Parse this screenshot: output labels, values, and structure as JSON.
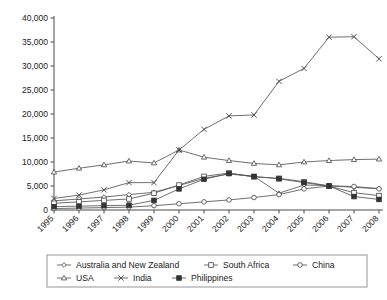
{
  "chart_data": {
    "type": "line",
    "title": "",
    "subtitle": "",
    "xlabel": "",
    "ylabel": "",
    "grid": false,
    "legend_position": "bottom",
    "categories": [
      "1995",
      "1996",
      "1997",
      "1998",
      "1999",
      "2000",
      "2001",
      "2002",
      "2003",
      "2004",
      "2005",
      "2006",
      "2007",
      "2008"
    ],
    "ylim": [
      0,
      40000
    ],
    "ytick_values": [
      0,
      5000,
      10000,
      15000,
      20000,
      25000,
      30000,
      35000,
      40000
    ],
    "ytick_labels": [
      "0",
      "5,000",
      "10,000",
      "15,000",
      "20,000",
      "25,000",
      "30,000",
      "35,000",
      "40,000"
    ],
    "series": [
      {
        "name": "Australia and New Zealand",
        "marker": "diamond",
        "values": [
          1900,
          2300,
          2700,
          3200,
          3700,
          5100,
          6600,
          7500,
          7000,
          3500,
          5200,
          5100,
          4700,
          4500
        ]
      },
      {
        "name": "South Africa",
        "marker": "square",
        "values": [
          1400,
          1700,
          2000,
          2300,
          3500,
          5200,
          7000,
          7700,
          6900,
          6600,
          5900,
          5000,
          3600,
          3000
        ]
      },
      {
        "name": "China",
        "marker": "circle",
        "values": [
          300,
          400,
          500,
          600,
          900,
          1300,
          1700,
          2100,
          2600,
          3200,
          4400,
          5000,
          4900,
          4400
        ]
      },
      {
        "name": "USA",
        "marker": "triangle",
        "values": [
          7900,
          8700,
          9400,
          10200,
          9800,
          12500,
          11000,
          10300,
          9700,
          9400,
          10000,
          10300,
          10500,
          10600
        ]
      },
      {
        "name": "India",
        "marker": "cross",
        "values": [
          2400,
          3100,
          4200,
          5700,
          5700,
          12500,
          16800,
          19600,
          19800,
          26800,
          29500,
          36000,
          36100,
          31500
        ]
      },
      {
        "name": "Philippines",
        "marker": "filled-square",
        "values": [
          700,
          800,
          900,
          1000,
          2000,
          4400,
          6400,
          7600,
          7000,
          6500,
          5700,
          5000,
          2800,
          2200
        ]
      }
    ]
  },
  "legend": {
    "entries": [
      {
        "label": "Australia and New Zealand",
        "marker": "diamond"
      },
      {
        "label": "South Africa",
        "marker": "square"
      },
      {
        "label": "China",
        "marker": "circle"
      },
      {
        "label": "USA",
        "marker": "triangle"
      },
      {
        "label": "India",
        "marker": "cross"
      },
      {
        "label": "Philippines",
        "marker": "filled-square"
      }
    ]
  },
  "colors": {
    "line": "#555555",
    "axis": "#4a4a4a",
    "text": "#1a1a1a",
    "background": "#ffffff",
    "legend_border": "#8a8a8a"
  }
}
